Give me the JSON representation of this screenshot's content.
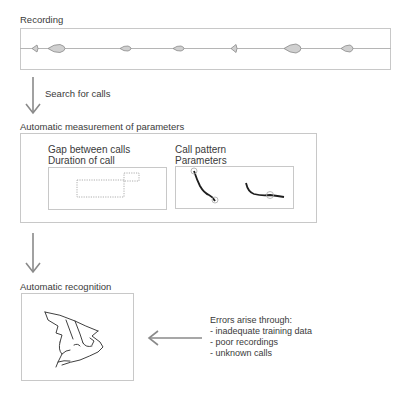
{
  "diagram": {
    "recording": {
      "title": "Recording",
      "calls": [
        {
          "x": 37,
          "size": "small"
        },
        {
          "x": 58,
          "size": "large"
        },
        {
          "x": 126,
          "size": "medium"
        },
        {
          "x": 179,
          "size": "medium"
        },
        {
          "x": 236,
          "size": "small"
        },
        {
          "x": 294,
          "size": "large"
        },
        {
          "x": 349,
          "size": "medium"
        }
      ]
    },
    "step1": {
      "label": "Search for calls"
    },
    "measurement": {
      "title": "Automatic measurement of parameters",
      "gap_panel": {
        "line1": "Gap between calls",
        "line2": "Duration of call"
      },
      "pattern_panel": {
        "line1": "Call pattern",
        "line2": "Parameters"
      }
    },
    "recognition": {
      "title": "Automatic recognition",
      "image": "bat-sketch"
    },
    "errors": {
      "heading": "Errors arise through:",
      "items": [
        "- inadequate training data",
        "- poor recordings",
        "- unknown calls"
      ]
    },
    "colors": {
      "line": "#b0b0b0",
      "box_border": "#c8c8c8",
      "call_fill": "#d0d0d0",
      "call_stroke": "#888888",
      "arrow": "#8a8a8a",
      "ink": "#222222"
    }
  }
}
